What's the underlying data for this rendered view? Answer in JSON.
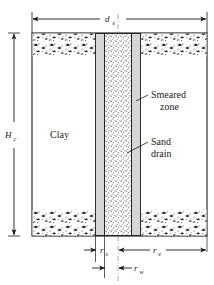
{
  "figure": {
    "labels": {
      "clay": "Clay",
      "smeared_zone_line1": "Smeared",
      "smeared_zone_line2": "zone",
      "sand_drain_line1": "Sand",
      "sand_drain_line2": "drain"
    },
    "dimensions": {
      "top": {
        "symbol": "d",
        "subscript": "e",
        "name": "effective-diameter"
      },
      "left": {
        "symbol": "H",
        "subscript": "c",
        "name": "clay-layer-thickness"
      },
      "bottom_inner": {
        "symbol": "r",
        "subscript": "s",
        "name": "smear-zone-radius"
      },
      "bottom_outer": {
        "symbol": "r",
        "subscript": "e",
        "name": "effective-radius"
      },
      "bottom_well": {
        "symbol": "r",
        "subscript": "w",
        "name": "drain-well-radius"
      }
    },
    "colors": {
      "line": "#1a1a1a",
      "smeared_fill": "#d6d6d6",
      "drain_fill": "#fbfbfb",
      "clay_fill": "#ffffff",
      "speckle": "#2b2b2b"
    }
  }
}
